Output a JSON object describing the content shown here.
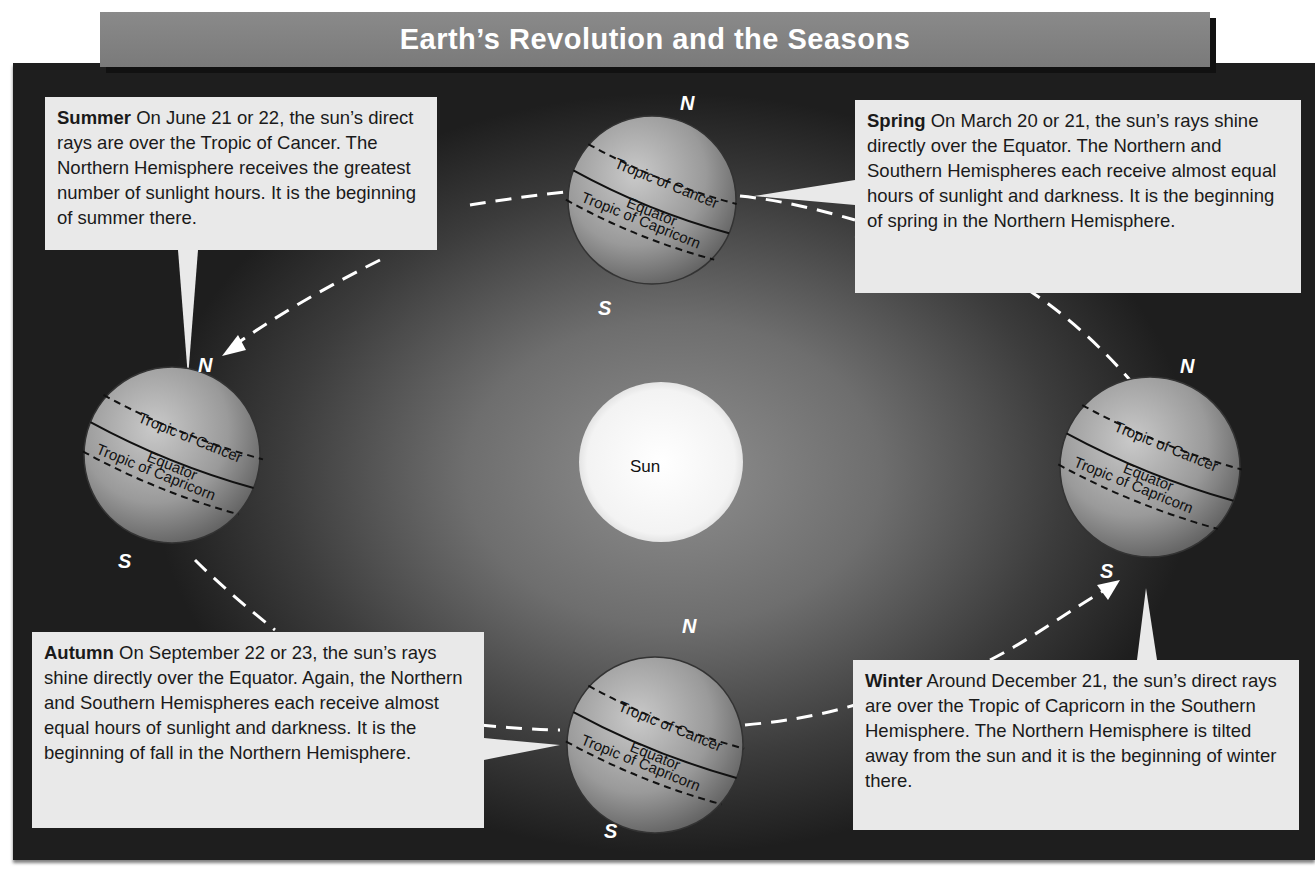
{
  "title": "Earth’s Revolution and the Seasons",
  "sun": {
    "label": "Sun"
  },
  "globe_labels": {
    "north": "N",
    "south": "S",
    "tropic_cancer": "Tropic of Cancer",
    "equator": "Equator",
    "tropic_capricorn": "Tropic of Capricorn"
  },
  "callouts": {
    "summer": {
      "season": "Summer",
      "text": " On June 21 or 22, the sun’s direct rays are over the Tropic of Cancer. The Northern Hemisphere receives the greatest number of sunlight hours. It is the beginning of summer there."
    },
    "spring": {
      "season": "Spring",
      "text": " On March 20 or 21, the sun’s rays shine directly over the Equator. The Northern and Southern Hemispheres each receive almost equal hours of sunlight and darkness. It is the beginning of spring in the Northern Hemisphere."
    },
    "autumn": {
      "season": "Autumn",
      "text": " On September 22 or 23, the sun’s rays shine directly over the Equator. Again, the Northern and Southern Hemispheres each receive almost equal hours of sunlight and darkness. It is the beginning of fall in the Northern Hemisphere."
    },
    "winter": {
      "season": "Winter",
      "text": " Around December 21, the sun’s direct rays are over the Tropic of Capricorn in the Southern Hemisphere. The Northern Hemisphere is tilted away from the sun and it is the beginning of winter there."
    }
  },
  "colors": {
    "background_center": "#8f8f8f",
    "background_edge": "#1e1e1e",
    "callout_fill": "#e9e9e9",
    "title_bar": "#7f7f7f",
    "sun_fill": "#f7f7f7",
    "globe_fill": "#9a9a9a"
  }
}
